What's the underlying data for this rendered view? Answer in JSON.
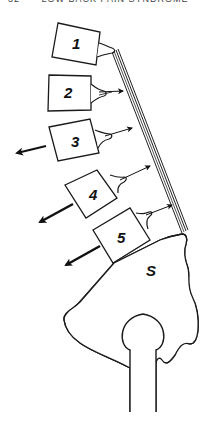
{
  "header": {
    "page_number": "32",
    "running_title": "LOW BACK PAIN SYNDROME"
  },
  "diagram": {
    "vertebrae": [
      {
        "label": "1"
      },
      {
        "label": "2"
      },
      {
        "label": "3"
      },
      {
        "label": "4"
      },
      {
        "label": "5"
      }
    ],
    "sacrum_label": "S",
    "colors": {
      "stroke": "#1a1a1a",
      "background": "#ffffff"
    }
  }
}
